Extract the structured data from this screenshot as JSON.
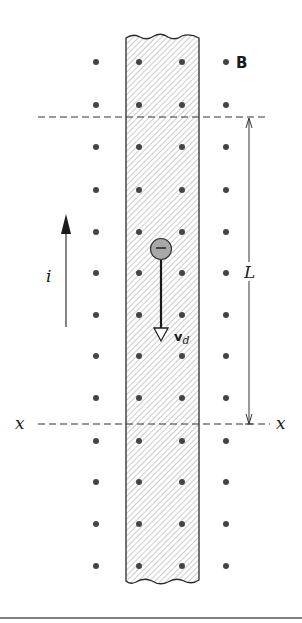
{
  "figure": {
    "field_label": "B",
    "current_label": "i",
    "length_label": "L",
    "section_label_left": "x",
    "section_label_right": "x",
    "drift_velocity_label": "v",
    "drift_velocity_subscript": "d",
    "electron_symbol": "−",
    "colors": {
      "ink": "#2a2a2a",
      "dot": "#444444",
      "electron_fill": "#a8a8a8",
      "hatch": "#9a9a9a",
      "background": "#ffffff"
    },
    "dot_columns_x": [
      96,
      139,
      182,
      226
    ],
    "dot_rows_y": [
      62,
      105,
      147,
      190,
      232,
      273,
      315,
      356,
      398,
      441,
      482,
      524,
      566
    ]
  }
}
